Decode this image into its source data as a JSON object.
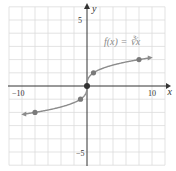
{
  "chart_data": {
    "type": "line",
    "title": "",
    "function_label": "f(x) = ∛x",
    "xlabel": "x",
    "ylabel": "y",
    "xlim": [
      -10,
      10
    ],
    "ylim": [
      -6,
      6
    ],
    "x_tick_labels": [
      "−10",
      "10"
    ],
    "y_tick_labels": [
      "5",
      "−5"
    ],
    "grid": true,
    "x_grid_step": 2,
    "y_grid_step": 1,
    "series": [
      {
        "name": "f(x) = ∛x",
        "marked_points": [
          {
            "x": -8,
            "y": -2
          },
          {
            "x": -1,
            "y": -1
          },
          {
            "x": 0,
            "y": 0
          },
          {
            "x": 1,
            "y": 1
          },
          {
            "x": 8,
            "y": 2
          }
        ],
        "arrows_at_ends": true
      }
    ],
    "colors": {
      "curve": "#8c8c8c",
      "points": "#7a7a7a",
      "grid": "#dcdcdc",
      "axes": "#333333"
    }
  },
  "labels": {
    "x_axis": "x",
    "y_axis": "y",
    "x_min": "−10",
    "x_max": "10",
    "y_max": "5",
    "y_min": "−5",
    "function": "f(x) = ∛x"
  }
}
